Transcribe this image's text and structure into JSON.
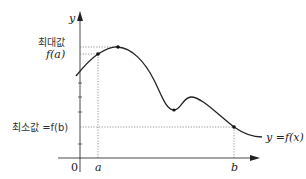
{
  "diagram": {
    "axes": {
      "x_label": "",
      "y_label": "y",
      "origin_label": "0",
      "x_ticks": [
        {
          "label": "a",
          "x": 98
        },
        {
          "label": "b",
          "x": 234
        }
      ]
    },
    "labels": {
      "max_korean": "최대값",
      "max_value": "f(a)",
      "min_text": "최소값 =f(b)",
      "curve_label": "y =f(x)"
    },
    "points": {
      "start": {
        "x": 80,
        "y": 72
      },
      "fa": {
        "x": 98,
        "y": 54
      },
      "peak": {
        "x": 118,
        "y": 47
      },
      "local_min": {
        "x": 172,
        "y": 110
      },
      "local_max": {
        "x": 190,
        "y": 97
      },
      "fb": {
        "x": 234,
        "y": 127
      },
      "end": {
        "x": 262,
        "y": 137
      }
    },
    "colors": {
      "stroke": "#222222",
      "dotted": "#555555",
      "background": "#ffffff"
    }
  }
}
